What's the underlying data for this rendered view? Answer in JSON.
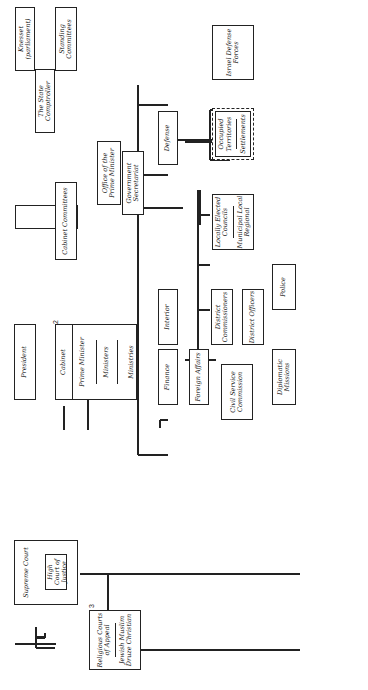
{
  "diagram": {
    "nodes": {
      "knesset": "Knesset (parliament)",
      "standing_committees": "Standing Committees",
      "state_comptroller": "The State Comptroller",
      "cabinet_committees": "Cabinet Committees",
      "president": "President",
      "cabinet": "Cabinet",
      "prime_minister": "Prime Minister",
      "ministers_inner": "Ministers",
      "ministries": "Ministries",
      "office_pm": "Office of the Prime Minister",
      "gov_secretariat": "Government Secretariat",
      "defense": "Defense",
      "idf": "Israel Defense Forces",
      "occupied": "Occupied Territories",
      "settlements": "Settlements",
      "interior": "Interior",
      "locally_elected": "Locally Elected Councils",
      "municipal": "Municipal Local Regional",
      "police": "Police",
      "district_commissioners": "District Commissioners",
      "district_officers": "District Officers",
      "finance": "Finance",
      "foreign_affairs": "Foreign Affairs",
      "civil_service": "Civil Service Commission",
      "diplomatic_missions": "Diplomatic Missions",
      "supreme_court": "Supreme Court",
      "high_court": "High Court of Justice",
      "religious_appeal": "Religious Courts of Appeal",
      "religious_appeal_list": "Jewish Muslim Druze Christian",
      "military_appeal": "Military Court of Appeal",
      "military_courts": "Military Courts",
      "district_courts": "District Courts",
      "special_courts": "Special Courts",
      "magistrate_courts": "Magistrate Courts",
      "religious_courts": "Religious Courts"
    },
    "footnote_markers": {
      "cabinet": "2",
      "religious_appeal": "3",
      "special_courts": "5"
    },
    "legend": [
      {
        "symbol": "dashed-arrow",
        "label": "Election"
      },
      {
        "symbol": "dotted-arrow",
        "label": "Appointment"
      },
      {
        "symbol": "solid-line",
        "label": "Control"
      },
      {
        "symbol": "double-arrow",
        "label": "Ceremonial relationship"
      },
      {
        "symbol": "wavy-arrow",
        "label": "Informal coordination"
      },
      {
        "symbol": "double-line-arrow",
        "label": "Very limited appellate jurisdiction over procedures"
      },
      {
        "symbol": "none",
        "label": "at courts of first instance only"
      },
      {
        "symbol": "thick-arrow",
        "label": "Concurrent jurisdiction in some cases"
      },
      {
        "symbol": "dashed-box",
        "label": "Under military control"
      }
    ],
    "footnotes": [
      {
        "n": "1",
        "text": "Administratively under the Ministry of Justice"
      },
      {
        "n": "2",
        "text": "Collective responsibility to the Knesset"
      },
      {
        "n": "3",
        "text": "Administratively under the Ministry for Religious Affairs"
      },
      {
        "n": "4",
        "text": "Administratively under the Ministry of Defense"
      },
      {
        "n": "5",
        "text": "Appealable directly to the High Court of Justice"
      },
      {
        "n": "",
        "text": "in the Supreme Court in some cases"
      }
    ]
  }
}
